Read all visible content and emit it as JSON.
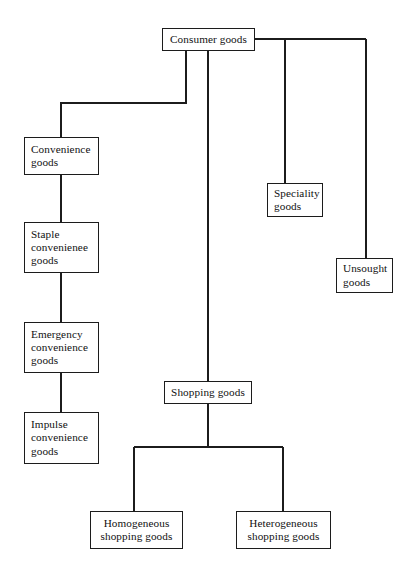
{
  "diagram": {
    "type": "tree",
    "line_color": "#1c1c1c",
    "box_border_color": "#1c1c1c",
    "background_color": "#ffffff",
    "nodes": {
      "consumer_goods": "Consumer goods",
      "convenience_goods": "Convenience\ngoods",
      "staple_convenience_goods": "Staple\nconvenienee\ngoods",
      "emergency_convenience_goods": "Emergency\nconvenience\ngoods",
      "impulse_convenience_goods": "Impulse\nconvenience\ngoods",
      "speciality_goods": "Speciality\ngoods",
      "unsought_goods": "Unsought\ngoods",
      "shopping_goods": "Shopping goods",
      "homogeneous_shopping_goods": "Homogeneous\nshopping goods",
      "heterogeneous_shopping_goods": "Heterogeneous\nshopping goods"
    },
    "edges": [
      {
        "from": "consumer_goods",
        "to": "convenience_goods"
      },
      {
        "from": "consumer_goods",
        "to": "shopping_goods"
      },
      {
        "from": "consumer_goods",
        "to": "speciality_goods"
      },
      {
        "from": "consumer_goods",
        "to": "unsought_goods"
      },
      {
        "from": "convenience_goods",
        "to": "staple_convenience_goods"
      },
      {
        "from": "staple_convenience_goods",
        "to": "emergency_convenience_goods"
      },
      {
        "from": "emergency_convenience_goods",
        "to": "impulse_convenience_goods"
      },
      {
        "from": "shopping_goods",
        "to": "homogeneous_shopping_goods"
      },
      {
        "from": "shopping_goods",
        "to": "heterogeneous_shopping_goods"
      }
    ]
  }
}
